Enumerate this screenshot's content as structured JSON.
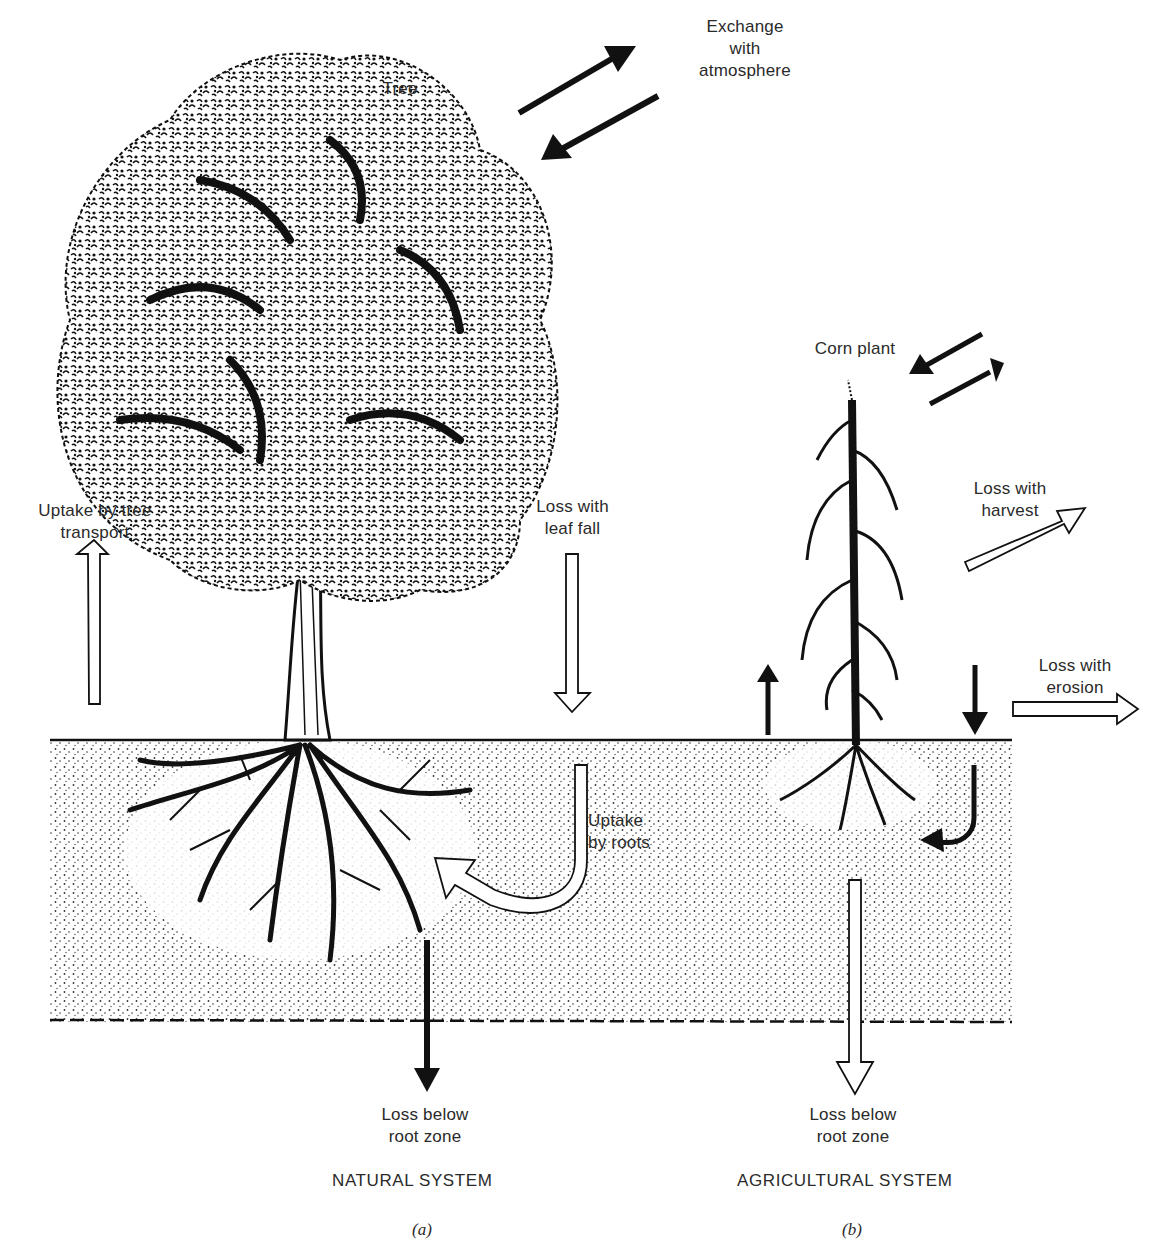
{
  "figure": {
    "panels": [
      {
        "id": "a",
        "caption": "(a)",
        "system_label": "NATURAL SYSTEM",
        "plant_label": "Tree",
        "flows": {
          "atmosphere": "Exchange\nwith\natmosphere",
          "uptake_transport": "Uptake by tree\ntransport",
          "leaf_fall": "Loss with\nleaf fall",
          "uptake_roots": "Uptake\nby roots",
          "below_root_zone": "Loss below\nroot zone"
        }
      },
      {
        "id": "b",
        "caption": "(b)",
        "system_label": "AGRICULTURAL SYSTEM",
        "plant_label": "Corn plant",
        "flows": {
          "harvest": "Loss with\nharvest",
          "erosion": "Loss with\nerosion",
          "below_root_zone": "Loss below\nroot zone"
        }
      }
    ],
    "colors": {
      "ink": "#111111",
      "soil_dot": "#333333",
      "paper": "#ffffff"
    }
  }
}
